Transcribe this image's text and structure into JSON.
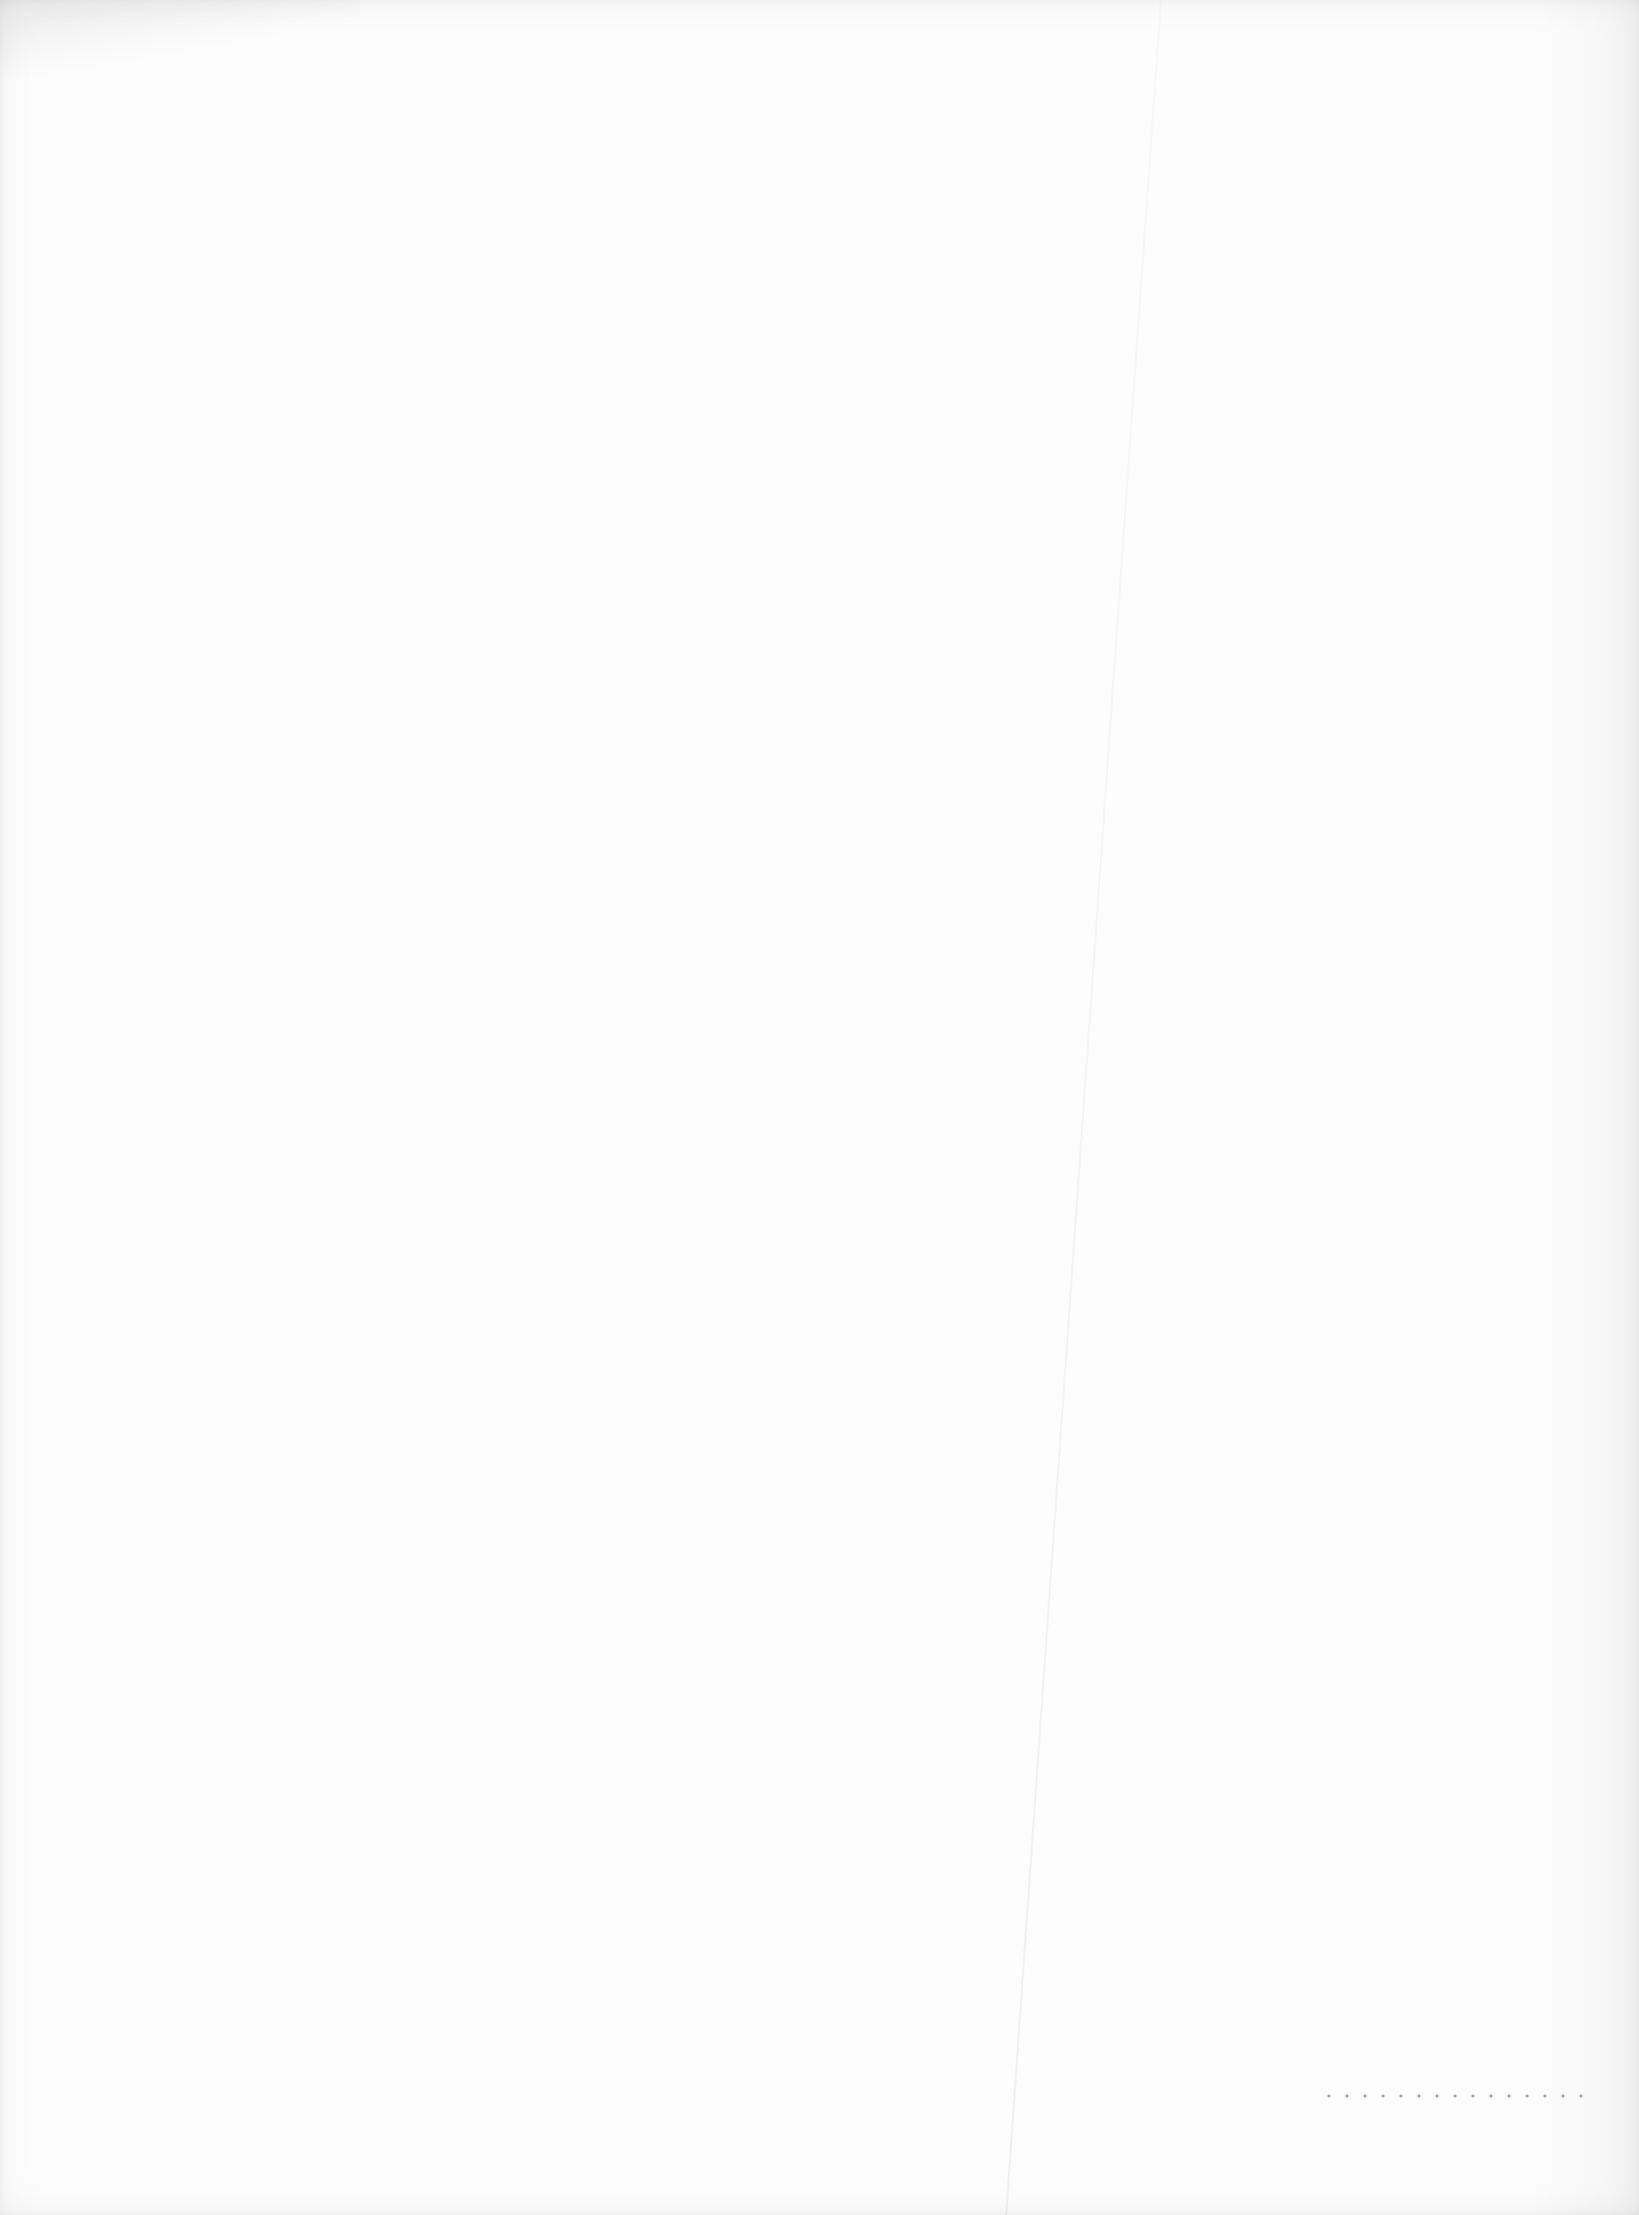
{
  "document": {
    "type": "blank scanned page",
    "visible_text": "",
    "bleed_through": {
      "line_1": "",
      "line_2": ""
    }
  }
}
